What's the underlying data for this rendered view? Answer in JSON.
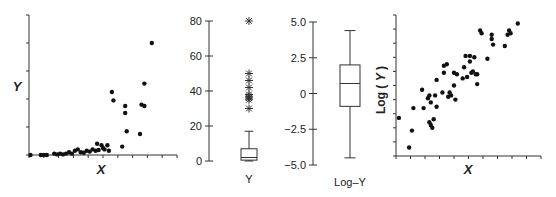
{
  "chart_data": [
    {
      "type": "scatter",
      "panel": "left",
      "xlabel": "X",
      "ylabel": "Y",
      "xlim": [
        0,
        10
      ],
      "ylim": [
        0,
        5
      ],
      "xticks_count": 11,
      "yticks_count": 6,
      "tick_labels": "none",
      "grid": false,
      "points": [
        [
          0.1,
          0.0
        ],
        [
          0.8,
          0.0
        ],
        [
          1.0,
          0.0
        ],
        [
          1.2,
          0.0
        ],
        [
          1.7,
          0.05
        ],
        [
          1.9,
          0.02
        ],
        [
          2.1,
          0.05
        ],
        [
          2.3,
          0.02
        ],
        [
          2.5,
          0.05
        ],
        [
          2.7,
          0.1
        ],
        [
          2.9,
          0.05
        ],
        [
          3.1,
          0.15
        ],
        [
          3.3,
          0.2
        ],
        [
          3.5,
          0.1
        ],
        [
          3.7,
          0.08
        ],
        [
          3.9,
          0.15
        ],
        [
          4.1,
          0.12
        ],
        [
          4.3,
          0.2
        ],
        [
          4.5,
          0.15
        ],
        [
          4.6,
          0.4
        ],
        [
          4.7,
          0.18
        ],
        [
          4.9,
          0.35
        ],
        [
          5.0,
          0.25
        ],
        [
          5.1,
          0.2
        ],
        [
          5.3,
          0.35
        ],
        [
          5.4,
          0.15
        ],
        [
          5.6,
          2.25
        ],
        [
          5.7,
          1.95
        ],
        [
          6.3,
          0.3
        ],
        [
          6.5,
          1.75
        ],
        [
          6.5,
          1.5
        ],
        [
          6.6,
          0.85
        ],
        [
          7.5,
          0.75
        ],
        [
          7.6,
          1.8
        ],
        [
          7.8,
          2.55
        ],
        [
          7.8,
          1.75
        ],
        [
          8.3,
          4.0
        ]
      ]
    },
    {
      "type": "box",
      "panel": "box-Y",
      "category": "Y",
      "ylim": [
        0,
        80
      ],
      "yticks": [
        0,
        20,
        40,
        60,
        80
      ],
      "min": 0,
      "q1": 0.5,
      "median": 2,
      "q3": 7,
      "whisker_high": 17,
      "outliers": [
        30,
        35,
        36,
        37,
        38,
        42,
        46,
        50,
        80
      ]
    },
    {
      "type": "box",
      "panel": "box-LogY",
      "category": "Log–Y",
      "ylim": [
        -5.0,
        5.0
      ],
      "yticks": [
        -5.0,
        -2.5,
        0,
        2.5,
        5.0
      ],
      "whisker_low": -4.5,
      "q1": -0.9,
      "median": 0.7,
      "q3": 2.0,
      "whisker_high": 4.4
    },
    {
      "type": "scatter",
      "panel": "right",
      "xlabel": "X",
      "ylabel": "Log ( Y )",
      "xlim": [
        0,
        10
      ],
      "ylim": [
        0,
        10
      ],
      "xticks_count": 11,
      "yticks_count": 11,
      "tick_labels": "none",
      "grid": false,
      "points": [
        [
          0.2,
          2.7
        ],
        [
          0.9,
          0.6
        ],
        [
          1.1,
          1.8
        ],
        [
          1.2,
          3.4
        ],
        [
          1.8,
          4.7
        ],
        [
          1.9,
          3.4
        ],
        [
          2.2,
          4.1
        ],
        [
          2.3,
          4.3
        ],
        [
          2.4,
          3.8
        ],
        [
          2.3,
          2.4
        ],
        [
          2.4,
          2.2
        ],
        [
          2.5,
          2.0
        ],
        [
          2.6,
          2.6
        ],
        [
          2.7,
          4.3
        ],
        [
          2.8,
          3.5
        ],
        [
          2.8,
          5.4
        ],
        [
          3.2,
          4.5
        ],
        [
          3.3,
          6.4
        ],
        [
          3.3,
          5.9
        ],
        [
          3.5,
          6.5
        ],
        [
          3.6,
          4.2
        ],
        [
          3.7,
          4.5
        ],
        [
          3.8,
          4.3
        ],
        [
          4.0,
          5.0
        ],
        [
          4.0,
          5.9
        ],
        [
          4.1,
          4.0
        ],
        [
          4.2,
          5.8
        ],
        [
          4.6,
          5.5
        ],
        [
          4.7,
          6.3
        ],
        [
          4.8,
          7.1
        ],
        [
          4.9,
          5.6
        ],
        [
          5.1,
          7.1
        ],
        [
          5.1,
          6.7
        ],
        [
          5.2,
          5.9
        ],
        [
          5.3,
          6.0
        ],
        [
          5.4,
          7.0
        ],
        [
          5.5,
          5.8
        ],
        [
          5.6,
          5.1
        ],
        [
          5.6,
          5.8
        ],
        [
          5.8,
          8.9
        ],
        [
          5.9,
          8.7
        ],
        [
          6.3,
          6.9
        ],
        [
          6.6,
          8.6
        ],
        [
          6.6,
          8.3
        ],
        [
          6.7,
          7.9
        ],
        [
          7.5,
          7.8
        ],
        [
          7.7,
          8.6
        ],
        [
          7.8,
          8.9
        ],
        [
          7.9,
          8.7
        ],
        [
          8.4,
          9.4
        ]
      ]
    }
  ],
  "panels": {
    "left": {
      "xlabel": "X",
      "ylabel": "Y"
    },
    "boxY": {
      "yticks": [
        "80",
        "60",
        "40",
        "20",
        "0"
      ],
      "category": "Y"
    },
    "boxLog": {
      "yticks": [
        "5.0",
        "2.5",
        "0",
        "−2.5",
        "−5.0"
      ],
      "category": "Log–Y"
    },
    "right": {
      "xlabel": "X",
      "ylabel": "Log ( Y )"
    }
  },
  "colors": {
    "axis": "#333333",
    "points": "#111111",
    "text": "#222222",
    "background": "#ffffff"
  }
}
